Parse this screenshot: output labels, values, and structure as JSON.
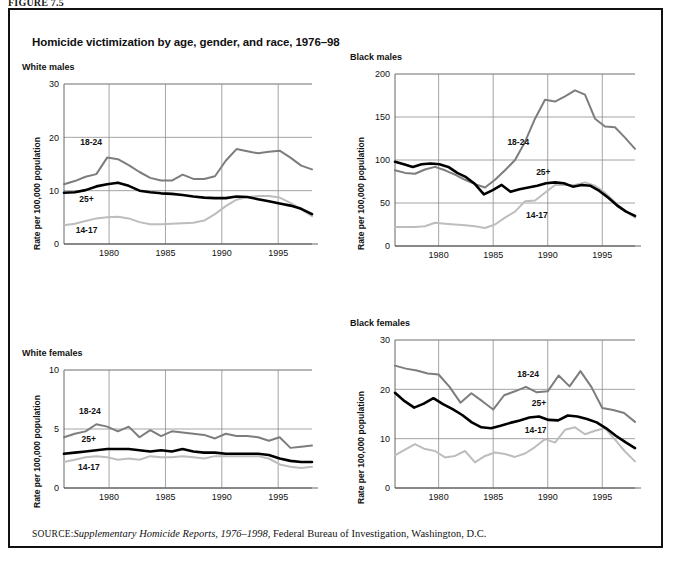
{
  "figure": {
    "label": "FIGURE 7.5",
    "title": "Homicide victimization by age, gender, and race, 1976–98",
    "source_keyword": "SOURCE:",
    "source_italic": "Supplementary Homicide Reports, 1976–1998",
    "source_rest": ", Federal Bureau of Investigation, Washington, D.C."
  },
  "colors": {
    "series_18_24": "#7d7d7d",
    "series_25plus": "#000000",
    "series_14_17": "#bdbdbd",
    "gridline": "#8d8d8d",
    "frame": "#111111",
    "background": "#ffffff"
  },
  "series_labels": {
    "a18_24": "18-24",
    "a25plus": "25+",
    "a14_17": "14-17"
  },
  "chart_data": [
    {
      "type": "line",
      "panel_id": "white-males",
      "title": "White males",
      "xlabel": "",
      "ylabel": "Rate per 100,000 population",
      "xlim": [
        1976,
        1998
      ],
      "ylim": [
        0,
        30
      ],
      "yticks": [
        0,
        10,
        20,
        30
      ],
      "xticks": [
        1980,
        1985,
        1990,
        1995
      ],
      "grid": true,
      "legend_position": "inline-annotations",
      "x": [
        1976,
        1977,
        1978,
        1979,
        1980,
        1981,
        1982,
        1983,
        1984,
        1985,
        1986,
        1987,
        1988,
        1989,
        1990,
        1991,
        1992,
        1993,
        1994,
        1995,
        1996,
        1997,
        1998
      ],
      "series": [
        {
          "name": "18-24",
          "color": "#7d7d7d",
          "values": [
            11.2,
            11.8,
            12.6,
            13.1,
            16.2,
            15.9,
            14.8,
            13.5,
            12.4,
            11.9,
            11.9,
            13.0,
            12.2,
            12.2,
            12.7,
            15.6,
            17.8,
            17.4,
            17.0,
            17.3,
            17.5,
            16.2,
            14.7,
            14.0
          ]
        },
        {
          "name": "25+",
          "color": "#000000",
          "values": [
            9.6,
            9.7,
            10.1,
            10.8,
            11.2,
            11.5,
            10.9,
            10.0,
            9.7,
            9.5,
            9.4,
            9.2,
            8.9,
            8.7,
            8.6,
            8.6,
            8.9,
            8.8,
            8.4,
            8.0,
            7.6,
            7.2,
            6.6,
            5.6
          ]
        },
        {
          "name": "14-17",
          "color": "#bdbdbd",
          "values": [
            3.5,
            3.8,
            4.3,
            4.8,
            5.0,
            5.1,
            4.8,
            4.1,
            3.7,
            3.7,
            3.8,
            3.9,
            4.0,
            4.4,
            5.6,
            7.1,
            8.3,
            8.8,
            9.0,
            9.0,
            8.7,
            7.7,
            6.5,
            5.2
          ]
        }
      ]
    },
    {
      "type": "line",
      "panel_id": "black-males",
      "title": "Black males",
      "xlabel": "",
      "ylabel": "Rate per 100,000 population",
      "xlim": [
        1976,
        1998
      ],
      "ylim": [
        0,
        200
      ],
      "yticks": [
        0,
        50,
        100,
        150,
        200
      ],
      "xticks": [
        1980,
        1985,
        1990,
        1995
      ],
      "grid": true,
      "legend_position": "inline-annotations",
      "x": [
        1976,
        1977,
        1978,
        1979,
        1980,
        1981,
        1982,
        1983,
        1984,
        1985,
        1986,
        1987,
        1988,
        1989,
        1990,
        1991,
        1992,
        1993,
        1994,
        1995,
        1996,
        1997,
        1998
      ],
      "series": [
        {
          "name": "18-24",
          "color": "#7d7d7d",
          "values": [
            88,
            85,
            84,
            89,
            92,
            88,
            83,
            77,
            72,
            68,
            77,
            88,
            100,
            121,
            148,
            170,
            168,
            174,
            181,
            176,
            148,
            139,
            138,
            126,
            113
          ]
        },
        {
          "name": "25+",
          "color": "#000000",
          "values": [
            98,
            95,
            92,
            95,
            96,
            95,
            92,
            85,
            80,
            72,
            60,
            65,
            71,
            63,
            66,
            68,
            70,
            73,
            74,
            73,
            69,
            71,
            70,
            64,
            56,
            47,
            40,
            35
          ]
        },
        {
          "name": "14-17",
          "color": "#bdbdbd",
          "values": [
            22,
            22,
            22,
            23,
            27,
            26,
            25,
            24,
            23,
            21,
            25,
            33,
            40,
            52,
            53,
            62,
            71,
            71,
            71,
            74,
            70,
            62,
            51,
            41,
            33
          ]
        }
      ]
    },
    {
      "type": "line",
      "panel_id": "white-females",
      "title": "White females",
      "xlabel": "",
      "ylabel": "Rate per 100,000 population",
      "xlim": [
        1976,
        1998
      ],
      "ylim": [
        0,
        10
      ],
      "yticks": [
        0,
        5,
        10
      ],
      "xticks": [
        1980,
        1985,
        1990,
        1995
      ],
      "grid": true,
      "legend_position": "inline-annotations",
      "x": [
        1976,
        1977,
        1978,
        1979,
        1980,
        1981,
        1982,
        1983,
        1984,
        1985,
        1986,
        1987,
        1988,
        1989,
        1990,
        1991,
        1992,
        1993,
        1994,
        1995,
        1996,
        1997,
        1998
      ],
      "series": [
        {
          "name": "18-24",
          "color": "#7d7d7d",
          "values": [
            4.3,
            4.6,
            4.8,
            5.4,
            5.2,
            4.8,
            5.2,
            4.3,
            4.9,
            4.4,
            4.8,
            4.7,
            4.6,
            4.5,
            4.2,
            4.6,
            4.4,
            4.4,
            4.3,
            4.0,
            4.3,
            3.4,
            3.5,
            3.6
          ]
        },
        {
          "name": "25+",
          "color": "#000000",
          "values": [
            2.9,
            3.0,
            3.1,
            3.2,
            3.3,
            3.3,
            3.3,
            3.2,
            3.1,
            3.2,
            3.1,
            3.3,
            3.1,
            3.0,
            3.0,
            2.9,
            2.9,
            2.9,
            2.9,
            2.8,
            2.5,
            2.3,
            2.2,
            2.2
          ]
        },
        {
          "name": "14-17",
          "color": "#bdbdbd",
          "values": [
            2.2,
            2.4,
            2.6,
            2.7,
            2.6,
            2.4,
            2.5,
            2.4,
            2.7,
            2.6,
            2.6,
            2.7,
            2.6,
            2.5,
            2.7,
            2.7,
            2.7,
            2.7,
            2.7,
            2.5,
            2.0,
            1.8,
            1.7,
            1.8
          ]
        }
      ]
    },
    {
      "type": "line",
      "panel_id": "black-females",
      "title": "Black females",
      "xlabel": "",
      "ylabel": "Rate per 100,000 population",
      "xlim": [
        1976,
        1998
      ],
      "ylim": [
        0,
        30
      ],
      "yticks": [
        0,
        10,
        20,
        30
      ],
      "xticks": [
        1980,
        1985,
        1990,
        1995
      ],
      "grid": true,
      "legend_position": "inline-annotations",
      "x": [
        1976,
        1977,
        1978,
        1979,
        1980,
        1981,
        1982,
        1983,
        1984,
        1985,
        1986,
        1987,
        1988,
        1989,
        1990,
        1991,
        1992,
        1993,
        1994,
        1995,
        1996,
        1997,
        1998
      ],
      "series": [
        {
          "name": "18-24",
          "color": "#7d7d7d",
          "values": [
            24.8,
            24.2,
            23.8,
            23.2,
            23.0,
            20.5,
            17.3,
            19.2,
            17.6,
            15.9,
            18.8,
            19.6,
            20.5,
            19.4,
            19.6,
            22.8,
            20.6,
            23.7,
            20.5,
            16.2,
            15.8,
            15.2,
            13.4
          ]
        },
        {
          "name": "25+",
          "color": "#000000",
          "values": [
            19.3,
            17.6,
            16.3,
            17.1,
            18.2,
            17.0,
            16.0,
            14.8,
            13.3,
            12.3,
            12.1,
            12.6,
            13.2,
            13.7,
            14.3,
            14.5,
            13.8,
            13.7,
            14.7,
            14.5,
            14.0,
            13.3,
            12.1,
            10.6,
            9.3,
            8.1
          ]
        },
        {
          "name": "14-17",
          "color": "#bdbdbd",
          "values": [
            6.6,
            7.8,
            8.9,
            7.9,
            7.5,
            6.2,
            6.5,
            7.5,
            5.2,
            6.5,
            7.2,
            6.9,
            6.3,
            7.0,
            8.3,
            9.9,
            9.2,
            11.8,
            12.3,
            10.9,
            11.6,
            12.1,
            9.8,
            7.4,
            5.4
          ]
        }
      ]
    }
  ]
}
